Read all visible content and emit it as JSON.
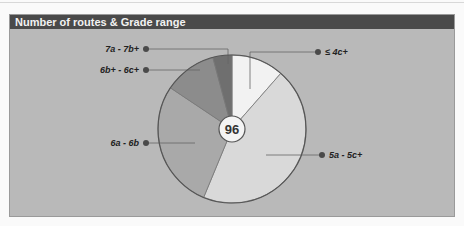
{
  "header": {
    "title": "Number of routes & Grade range"
  },
  "colors": {
    "panel_bg": "#b9b9b9",
    "header_bg": "#4a4a4a",
    "outline": "#555555"
  },
  "chart_data": {
    "type": "pie",
    "title": "Number of routes & Grade range",
    "center_label": "96",
    "total": 96,
    "slices": [
      {
        "label": "≤ 4c+",
        "value": 11,
        "color": "#f2f2f2"
      },
      {
        "label": "5a - 5c+",
        "value": 43,
        "color": "#d9d9d9"
      },
      {
        "label": "6a - 6b",
        "value": 27,
        "color": "#a9a9a9"
      },
      {
        "label": "6b+ - 6c+",
        "value": 11,
        "color": "#8c8c8c"
      },
      {
        "label": "7a - 7b+",
        "value": 4,
        "color": "#6f6f6f"
      }
    ],
    "legend_position": "callouts"
  }
}
